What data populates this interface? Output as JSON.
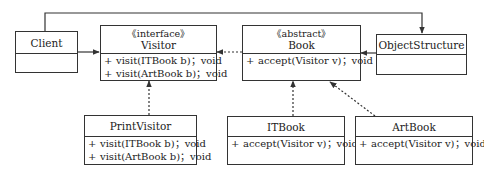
{
  "diagram": {
    "type": "uml-class-diagram",
    "pattern": "Visitor",
    "classes": [
      {
        "id": "client",
        "name": "Client",
        "stereotype": "",
        "operations": []
      },
      {
        "id": "visitor",
        "name": "Visitor",
        "stereotype": "《interface》",
        "operations": [
          {
            "visibility": "+",
            "signature": "visit(ITBook b)；void"
          },
          {
            "visibility": "+",
            "signature": "visit(ArtBook b)；void"
          }
        ]
      },
      {
        "id": "book",
        "name": "Book",
        "stereotype": "《abstract》",
        "operations": [
          {
            "visibility": "+",
            "signature": "accept(Visitor v)；void"
          }
        ]
      },
      {
        "id": "objectstructure",
        "name": "ObjectStructure",
        "stereotype": "",
        "operations": []
      },
      {
        "id": "printvisitor",
        "name": "PrintVisitor",
        "stereotype": "",
        "operations": [
          {
            "visibility": "+",
            "signature": "visit(ITBook b)；void"
          },
          {
            "visibility": "+",
            "signature": "visit(ArtBook b)；void"
          }
        ]
      },
      {
        "id": "itbook",
        "name": "ITBook",
        "stereotype": "",
        "operations": [
          {
            "visibility": "+",
            "signature": "accept(Visitor v)；void"
          }
        ]
      },
      {
        "id": "artbook",
        "name": "ArtBook",
        "stereotype": "",
        "operations": [
          {
            "visibility": "+",
            "signature": "accept(Visitor v)；void"
          }
        ]
      }
    ],
    "relationships": [
      {
        "from": "client",
        "to": "visitor",
        "type": "association",
        "style": "solid"
      },
      {
        "from": "client",
        "to": "objectstructure",
        "type": "association",
        "style": "solid"
      },
      {
        "from": "objectstructure",
        "to": "book",
        "type": "association",
        "style": "solid"
      },
      {
        "from": "book",
        "to": "visitor",
        "type": "dependency",
        "style": "dashed"
      },
      {
        "from": "printvisitor",
        "to": "visitor",
        "type": "realization",
        "style": "dashed"
      },
      {
        "from": "itbook",
        "to": "book",
        "type": "generalization",
        "style": "dashed"
      },
      {
        "from": "artbook",
        "to": "book",
        "type": "generalization",
        "style": "dashed"
      }
    ],
    "colors": {
      "line": "#333333",
      "background": "#ffffff",
      "text": "#222222"
    }
  }
}
